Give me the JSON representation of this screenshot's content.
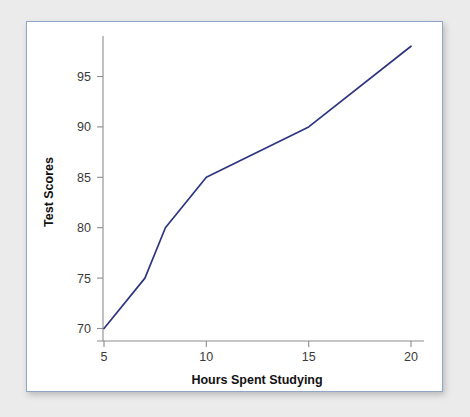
{
  "figure": {
    "background_color": "#ebebeb",
    "card_background_color": "#ffffff",
    "card_border_color": "#8fa6c8"
  },
  "chart_data": {
    "type": "line",
    "title": "",
    "subtitle": "",
    "xlabel": "Hours Spent Studying",
    "ylabel": "Test Scores",
    "x": [
      5,
      7,
      8,
      10,
      15,
      20
    ],
    "values": [
      70,
      75,
      80,
      85,
      90,
      98
    ],
    "series": [
      {
        "name": "Test Scores",
        "color": "#2e3580",
        "x": [
          5,
          7,
          8,
          10,
          15,
          20
        ],
        "values": [
          70,
          75,
          80,
          85,
          90,
          98
        ]
      }
    ],
    "xlim": [
      4.6,
      20.6
    ],
    "ylim": [
      69.2,
      98.6
    ],
    "xticks": [
      5,
      10,
      15,
      20
    ],
    "xtick_labels": [
      "5",
      "10",
      "15",
      "20"
    ],
    "yticks": [
      70,
      75,
      80,
      85,
      90,
      95
    ],
    "ytick_labels": [
      "70",
      "75",
      "80",
      "85",
      "90",
      "95"
    ],
    "grid": false,
    "legend": false,
    "legend_position": "none",
    "annotations": []
  },
  "axes": {
    "x_tick_labels": [
      "5",
      "10",
      "15",
      "20"
    ],
    "y_tick_labels": [
      "70",
      "75",
      "80",
      "85",
      "90",
      "95"
    ],
    "x_axis_title": "Hours Spent Studying",
    "y_axis_title": "Test Scores"
  }
}
